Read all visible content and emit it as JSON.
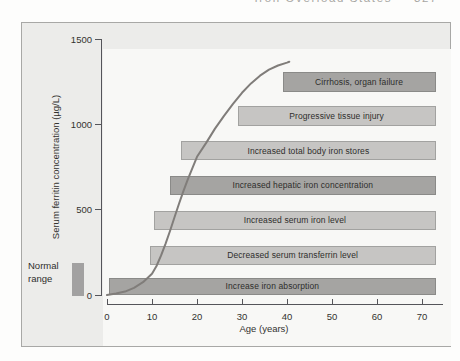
{
  "page": {
    "running_header": "Iron Overload States",
    "page_number": "327"
  },
  "chart_data": {
    "type": "line",
    "title": "",
    "xlabel": "Age (years)",
    "ylabel": "Serum ferritin concentration (µg/L)",
    "xlim": [
      0,
      74.7
    ],
    "ylim": [
      0,
      1500
    ],
    "x_ticks": [
      0,
      10,
      20,
      30,
      40,
      50,
      60,
      70
    ],
    "y_ticks": [
      0,
      500,
      1000,
      1500
    ],
    "grid": false,
    "legend": "none",
    "curve_points": [
      [
        0,
        0
      ],
      [
        2,
        8
      ],
      [
        4,
        20
      ],
      [
        6,
        42
      ],
      [
        8,
        75
      ],
      [
        10,
        125
      ],
      [
        11,
        170
      ],
      [
        12,
        230
      ],
      [
        13,
        300
      ],
      [
        14,
        375
      ],
      [
        15,
        455
      ],
      [
        16,
        535
      ],
      [
        17,
        610
      ],
      [
        18,
        680
      ],
      [
        19,
        745
      ],
      [
        20,
        810
      ],
      [
        22,
        890
      ],
      [
        24,
        975
      ],
      [
        26,
        1050
      ],
      [
        28,
        1120
      ],
      [
        30,
        1185
      ],
      [
        32,
        1240
      ],
      [
        34,
        1285
      ],
      [
        36,
        1320
      ],
      [
        38,
        1345
      ],
      [
        40,
        1362
      ],
      [
        40.5,
        1367
      ]
    ],
    "stage_bars": [
      {
        "label": "Cirrhosis, organ failure",
        "age_start": 39,
        "age_end": 73,
        "ferritin_min": 1190,
        "ferritin_max": 1305,
        "shade": "dark"
      },
      {
        "label": "Progressive tissue injury",
        "age_start": 29,
        "age_end": 73,
        "ferritin_min": 990,
        "ferritin_max": 1105,
        "shade": "light"
      },
      {
        "label": "Increased total body iron stores",
        "age_start": 16.5,
        "age_end": 73,
        "ferritin_min": 790,
        "ferritin_max": 900,
        "shade": "light"
      },
      {
        "label": "Increased hepatic iron concentration",
        "age_start": 14,
        "age_end": 73,
        "ferritin_min": 585,
        "ferritin_max": 700,
        "shade": "dark"
      },
      {
        "label": "Increased serum iron level",
        "age_start": 10.5,
        "age_end": 73,
        "ferritin_min": 380,
        "ferritin_max": 495,
        "shade": "light"
      },
      {
        "label": "Decreased serum transferrin level",
        "age_start": 9.5,
        "age_end": 73,
        "ferritin_min": 175,
        "ferritin_max": 290,
        "shade": "light"
      },
      {
        "label": "Increase iron absorption",
        "age_start": 0.5,
        "age_end": 73,
        "ferritin_min": 0,
        "ferritin_max": 102,
        "shade": "dark"
      }
    ],
    "normal_range": {
      "label_lines": [
        "Normal",
        "range"
      ],
      "ferritin_min": 0,
      "ferritin_max": 185
    }
  },
  "colors": {
    "dark_bar": "#a5a4a2",
    "dark_bar_border": "#8a8a88",
    "light_bar": "#c6c5c3",
    "light_bar_border": "#a2a2a0",
    "normal_bar": "#a2a1a1",
    "curve": "#807d7a",
    "axis": "#55555a",
    "panel_bg": "#ececea",
    "panel_border": "#a8a8a6",
    "plot_bg": "#f8f8f6",
    "text": "#2e2e2c"
  }
}
